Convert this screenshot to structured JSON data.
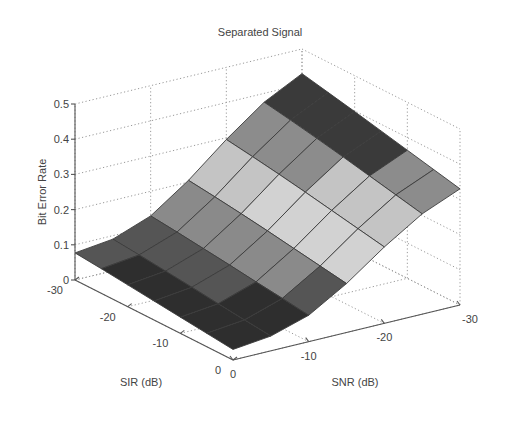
{
  "chart_data": {
    "type": "surface",
    "title": "Separated Signal",
    "xlabel": "SIR (dB)",
    "ylabel": "SNR (dB)",
    "zlabel": "Bit Error Rate",
    "x_ticks": [
      "-30",
      "-20",
      "-10",
      "0"
    ],
    "y_ticks": [
      "0",
      "-10",
      "-20",
      "-30"
    ],
    "z_ticks": [
      "0",
      "0.1",
      "0.2",
      "0.3",
      "0.4",
      "0.5"
    ],
    "xlim": [
      -30,
      0
    ],
    "ylim": [
      -30,
      0
    ],
    "zlim": [
      0,
      0.5
    ],
    "grid": true,
    "colormap": "gray-banded",
    "sir": [
      -30,
      -25,
      -20,
      -15,
      -10,
      -5,
      0
    ],
    "snr": [
      0,
      -5,
      -10,
      -15,
      -20,
      -25,
      -30
    ],
    "ber": [
      [
        0.077,
        0.09,
        0.13,
        0.205,
        0.295,
        0.375,
        0.43
      ],
      [
        0.07,
        0.083,
        0.122,
        0.196,
        0.284,
        0.362,
        0.414
      ],
      [
        0.062,
        0.075,
        0.113,
        0.186,
        0.272,
        0.348,
        0.398
      ],
      [
        0.054,
        0.067,
        0.104,
        0.175,
        0.259,
        0.333,
        0.381
      ],
      [
        0.046,
        0.058,
        0.094,
        0.163,
        0.245,
        0.317,
        0.364
      ],
      [
        0.038,
        0.05,
        0.085,
        0.151,
        0.231,
        0.301,
        0.347
      ],
      [
        0.03,
        0.042,
        0.075,
        0.139,
        0.217,
        0.285,
        0.33
      ]
    ]
  },
  "figure": {
    "title": "Separated Signal",
    "zlabel": "Bit Error Rate",
    "xlabel": "SIR (dB)",
    "ylabel": "SNR (dB)"
  }
}
